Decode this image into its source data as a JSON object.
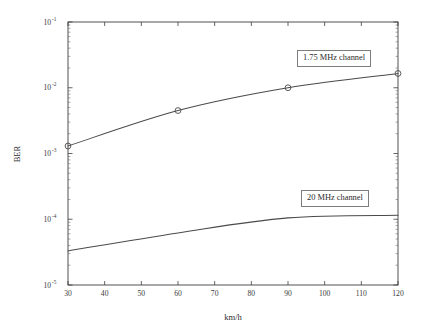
{
  "chart_data": {
    "type": "line",
    "title": "",
    "xlabel": "km/h",
    "ylabel": "BER",
    "yscale": "log",
    "xscale": "linear",
    "xlim": [
      30,
      120
    ],
    "ylim": [
      1e-05,
      0.1
    ],
    "grid": false,
    "legend_position": "inside-annotations",
    "x_ticks": [
      30,
      40,
      50,
      60,
      70,
      80,
      90,
      100,
      110,
      120
    ],
    "x_tick_labels": [
      "30",
      "40",
      "50",
      "60",
      "70",
      "80",
      "90",
      "100",
      "110",
      "120"
    ],
    "y_ticks": [
      1e-05,
      0.0001,
      0.001,
      0.01,
      0.1
    ],
    "y_tick_labels": [
      "10⁻⁵",
      "10⁻⁴",
      "10⁻³",
      "10⁻²",
      "10⁻¹"
    ],
    "y_tick_mantissa": [
      "10",
      "10",
      "10",
      "10",
      "10"
    ],
    "y_tick_exponent": [
      "-5",
      "-4",
      "-3",
      "-2",
      "-1"
    ],
    "series": [
      {
        "name": "1.75 MHz channel",
        "marker": "circle",
        "x": [
          30,
          60,
          90,
          120
        ],
        "values": [
          0.0013,
          0.0045,
          0.01,
          0.0165
        ],
        "color": "#4a4a4a"
      },
      {
        "name": "20 MHz channel",
        "marker": "none",
        "x": [
          30,
          60,
          90,
          120
        ],
        "values": [
          3.3e-05,
          6.2e-05,
          0.000105,
          0.000115
        ],
        "color": "#4a4a4a"
      }
    ],
    "annotations": [
      {
        "text": "1.75 MHz channel",
        "target_series": "1.75 MHz channel"
      },
      {
        "text": "20 MHz channel",
        "target_series": "20 MHz channel"
      }
    ]
  },
  "figure": {
    "background_color": "#ffffff",
    "axis_color": "#3f3f3f",
    "line_color": "#4a4a4a"
  }
}
